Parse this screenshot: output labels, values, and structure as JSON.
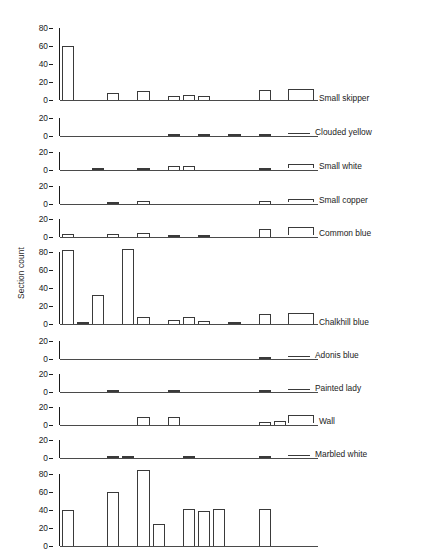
{
  "figure": {
    "ylabel": "Section count",
    "n_sections": 17,
    "axis_color": "#1b1b1b",
    "bar_edge_color": "#3a3a3a",
    "bar_fill_color": "#ffffff",
    "background": "#ffffff"
  },
  "chart_data": {
    "type": "bar",
    "title": "",
    "xlabel": "",
    "ylabel": "Section count",
    "grid": false,
    "legend_position": "right-of-panel",
    "x": [
      1,
      2,
      3,
      4,
      5,
      6,
      7,
      8,
      9,
      10,
      11,
      12,
      13,
      14,
      15,
      16,
      17
    ],
    "panels": [
      {
        "name": "Small skipper",
        "ylim": [
          0,
          80
        ],
        "yticks": [
          0,
          20,
          40,
          60,
          80
        ],
        "values": [
          60,
          0,
          0,
          8,
          0,
          10,
          0,
          4,
          6,
          4,
          0,
          0,
          0,
          11,
          0,
          0,
          0
        ]
      },
      {
        "name": "Clouded yellow",
        "ylim": [
          0,
          20
        ],
        "yticks": [
          0,
          20
        ],
        "values": [
          0,
          0,
          0,
          0,
          0,
          0,
          0,
          1,
          0,
          1,
          0,
          1,
          0,
          1,
          0,
          0,
          0
        ]
      },
      {
        "name": "Small white",
        "ylim": [
          0,
          20
        ],
        "yticks": [
          0,
          20
        ],
        "values": [
          0,
          0,
          1,
          0,
          0,
          2,
          0,
          4,
          4,
          0,
          0,
          0,
          0,
          1,
          0,
          0,
          0
        ]
      },
      {
        "name": "Small copper",
        "ylim": [
          0,
          20
        ],
        "yticks": [
          0,
          20
        ],
        "values": [
          0,
          0,
          0,
          1,
          0,
          3,
          0,
          0,
          0,
          0,
          0,
          0,
          0,
          3,
          0,
          0,
          0
        ]
      },
      {
        "name": "Common blue",
        "ylim": [
          0,
          20
        ],
        "yticks": [
          0,
          20
        ],
        "values": [
          3,
          0,
          0,
          3,
          0,
          4,
          0,
          1,
          0,
          2,
          0,
          0,
          0,
          9,
          0,
          0,
          0
        ]
      },
      {
        "name": "Chalkhill blue",
        "ylim": [
          0,
          80
        ],
        "yticks": [
          0,
          20,
          40,
          60,
          80
        ],
        "values": [
          82,
          1,
          32,
          0,
          83,
          8,
          0,
          4,
          8,
          3,
          0,
          1,
          0,
          11,
          0,
          0,
          0
        ]
      },
      {
        "name": "Adonis blue",
        "ylim": [
          0,
          20
        ],
        "yticks": [
          0,
          20
        ],
        "values": [
          0,
          0,
          0,
          0,
          0,
          0,
          0,
          0,
          0,
          0,
          0,
          0,
          0,
          1,
          0,
          0,
          0
        ]
      },
      {
        "name": "Painted lady",
        "ylim": [
          0,
          20
        ],
        "yticks": [
          0,
          20
        ],
        "values": [
          0,
          0,
          0,
          1,
          0,
          0,
          0,
          1,
          0,
          0,
          0,
          0,
          0,
          1,
          0,
          0,
          0
        ]
      },
      {
        "name": "Wall",
        "ylim": [
          0,
          20
        ],
        "yticks": [
          0,
          20
        ],
        "values": [
          0,
          0,
          0,
          0,
          0,
          9,
          0,
          9,
          0,
          0,
          0,
          0,
          0,
          3,
          4,
          0,
          0
        ]
      },
      {
        "name": "Marbled white",
        "ylim": [
          0,
          20
        ],
        "yticks": [
          0,
          20
        ],
        "values": [
          0,
          0,
          0,
          1,
          1,
          0,
          0,
          0,
          1,
          0,
          0,
          0,
          0,
          1,
          0,
          0,
          0
        ]
      },
      {
        "name": "",
        "ylim": [
          0,
          80
        ],
        "yticks": [
          0,
          20,
          40,
          60,
          80
        ],
        "values": [
          40,
          0,
          0,
          60,
          0,
          84,
          24,
          0,
          41,
          39,
          41,
          0,
          0,
          41,
          0,
          0,
          0
        ]
      }
    ]
  }
}
